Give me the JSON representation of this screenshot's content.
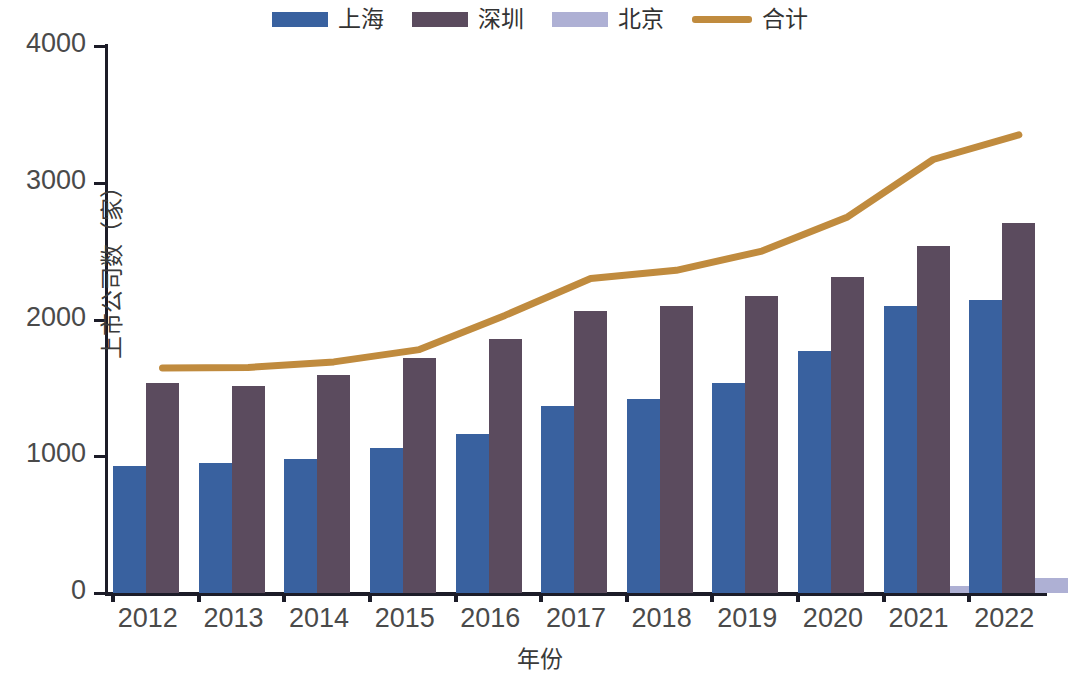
{
  "chart_data": {
    "type": "bar",
    "title": "",
    "xlabel": "年份",
    "ylabel": "上市公司数（家）",
    "categories": [
      "2012",
      "2013",
      "2014",
      "2015",
      "2016",
      "2017",
      "2018",
      "2019",
      "2020",
      "2021",
      "2022"
    ],
    "ylim": [
      0,
      4000
    ],
    "yticks": [
      0,
      1000,
      2000,
      3000,
      4000
    ],
    "ytick_labels": [
      "0",
      "1000",
      "2000",
      "3000",
      "4000"
    ],
    "grid": false,
    "legend_position": "top-center",
    "series": [
      {
        "name": "上海",
        "kind": "bar",
        "color": "#39619f",
        "values": [
          930,
          950,
          980,
          1060,
          1162,
          1367,
          1418,
          1535,
          1770,
          2100,
          2140
        ]
      },
      {
        "name": "深圳",
        "kind": "bar",
        "color": "#5b4b5e",
        "values": [
          1536,
          1514,
          1594,
          1718,
          1856,
          2062,
          2098,
          2171,
          2312,
          2537,
          2705
        ]
      },
      {
        "name": "北京",
        "kind": "bar",
        "color": "#aeb0d4",
        "values": [
          0,
          0,
          0,
          0,
          0,
          0,
          0,
          0,
          0,
          51,
          110
        ]
      },
      {
        "name": "合计",
        "kind": "line",
        "color": "#c08b3e",
        "values": [
          1645,
          1650,
          1690,
          1780,
          1890,
          2030,
          2300,
          2360,
          2420,
          2490,
          2620
        ]
      }
    ],
    "line_values": [
      1645,
      1650,
      1690,
      1780,
      1890,
      2030,
      2300,
      2360,
      2500,
      2750,
      3170,
      3350
    ],
    "totals": [
      1645,
      1650,
      1690,
      1780,
      2030,
      2300,
      2360,
      2500,
      2750,
      3170,
      3350
    ]
  },
  "legend": {
    "items": [
      {
        "label": "上海",
        "marker": "bar",
        "color": "#39619f"
      },
      {
        "label": "深圳",
        "marker": "bar",
        "color": "#5b4b5e"
      },
      {
        "label": "北京",
        "marker": "bar",
        "color": "#aeb0d4"
      },
      {
        "label": "合计",
        "marker": "line",
        "color": "#c08b3e"
      }
    ]
  }
}
